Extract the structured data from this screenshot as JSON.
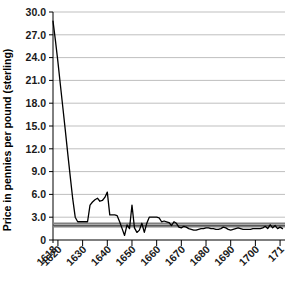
{
  "chart_data": {
    "type": "line",
    "title": "",
    "xlabel": "",
    "ylabel": "Price in pennies per pound (sterling)",
    "xlim": [
      1618,
      1712
    ],
    "ylim": [
      0,
      30
    ],
    "ytick_labels": [
      "30.0",
      "27.0",
      "24.0",
      "21.0",
      "18.0",
      "15.0",
      "12.0",
      "9.0",
      "6.0",
      "3.0",
      "0"
    ],
    "ytick_values": [
      30,
      27,
      24,
      21,
      18,
      15,
      12,
      9,
      6,
      3,
      0
    ],
    "xtick_labels": [
      "1618",
      "1620",
      "1630",
      "1640",
      "1650",
      "1660",
      "1670",
      "1680",
      "1690",
      "1700",
      "171"
    ],
    "xtick_values": [
      1618,
      1620,
      1630,
      1640,
      1650,
      1660,
      1670,
      1680,
      1690,
      1700,
      1710
    ],
    "grid": "horizontal",
    "legend": "none",
    "series": [
      {
        "name": "Price in pennies per pound (sterling)",
        "color": "#000000",
        "x": [
          1618,
          1619,
          1620,
          1621,
          1622,
          1623,
          1624,
          1625,
          1626,
          1627,
          1628,
          1629,
          1630,
          1631,
          1632,
          1633,
          1634,
          1635,
          1636,
          1637,
          1638,
          1639,
          1640,
          1641,
          1642,
          1643,
          1644,
          1645,
          1646,
          1647,
          1648,
          1649,
          1650,
          1651,
          1652,
          1653,
          1654,
          1655,
          1656,
          1657,
          1658,
          1659,
          1660,
          1661,
          1662,
          1663,
          1664,
          1665,
          1666,
          1667,
          1668,
          1669,
          1670,
          1671,
          1672,
          1673,
          1674,
          1675,
          1676,
          1677,
          1678,
          1679,
          1680,
          1681,
          1682,
          1683,
          1684,
          1685,
          1686,
          1687,
          1688,
          1689,
          1690,
          1691,
          1692,
          1693,
          1694,
          1695,
          1696,
          1697,
          1698,
          1699,
          1700,
          1701,
          1702,
          1703,
          1704,
          1705,
          1706,
          1707,
          1708,
          1709,
          1710,
          1711
        ],
        "y": [
          28.8,
          26.2,
          23.4,
          20.4,
          17.4,
          14.4,
          11.3,
          8.3,
          5.4,
          3.0,
          2.4,
          2.4,
          2.4,
          2.4,
          2.4,
          4.6,
          5.0,
          5.3,
          5.5,
          5.1,
          5.2,
          5.6,
          6.3,
          3.3,
          3.3,
          3.3,
          3.2,
          2.4,
          1.5,
          0.6,
          2.0,
          1.5,
          4.6,
          1.6,
          1.0,
          1.3,
          2.2,
          1.0,
          2.2,
          3.0,
          3.0,
          3.0,
          3.0,
          2.9,
          2.4,
          2.5,
          2.4,
          2.3,
          1.9,
          2.4,
          2.2,
          1.7,
          1.6,
          1.8,
          1.7,
          1.5,
          1.4,
          1.3,
          1.3,
          1.4,
          1.5,
          1.5,
          1.6,
          1.6,
          1.5,
          1.5,
          1.4,
          1.4,
          1.5,
          1.7,
          1.6,
          1.4,
          1.3,
          1.4,
          1.5,
          1.6,
          1.5,
          1.4,
          1.4,
          1.4,
          1.4,
          1.5,
          1.5,
          1.5,
          1.5,
          1.6,
          1.8,
          1.5,
          2.0,
          1.6,
          1.9,
          1.5,
          1.7,
          1.5
        ]
      },
      {
        "name": "reference-line-upper",
        "color": "#808080",
        "constant": 2.2
      },
      {
        "name": "reference-line-middle",
        "color": "#595959",
        "constant": 1.95
      },
      {
        "name": "reference-line-lower",
        "color": "#808080",
        "constant": 1.75
      }
    ]
  },
  "colors": {
    "line": "#000000",
    "grid": "#bfbfbf",
    "axis": "#000000",
    "reference": "#808080",
    "text": "#1a1a1a",
    "background": "#ffffff"
  }
}
